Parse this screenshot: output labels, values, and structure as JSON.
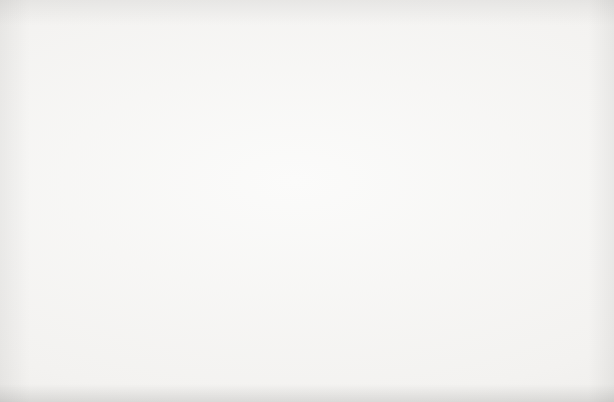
{
  "caption": {
    "fragment": "and red points are years"
  },
  "figure": {
    "background_color": "#f2f1ef",
    "ink_color": "#2b2b2b",
    "point_color": "#3a3a3c"
  },
  "chart_data": {
    "type": "scatter",
    "title": "",
    "xlabel": "Real GDP",
    "xlabel_sub": "(Trillions of 2009 Dollars)",
    "ylabel": "Price level (2009 = 100)",
    "xlim": [
      0.0,
      19.1
    ],
    "ylim": [
      0,
      127
    ],
    "xticks": [
      "0.0",
      "3.0",
      "6.0",
      "9.0",
      "12.0",
      "15.0",
      "18.0"
    ],
    "xtick_values": [
      0.0,
      3.0,
      6.0,
      9.0,
      12.0,
      15.0,
      18.0
    ],
    "yticks": [
      "0",
      "20",
      "40",
      "60",
      "80",
      "100",
      "120"
    ],
    "ytick_values": [
      0,
      20,
      40,
      60,
      80,
      100,
      120
    ],
    "grid": false,
    "legend": "none",
    "series": [
      {
        "name": "US Real GDP vs Price Level, 1929-2014",
        "marker": "circle",
        "color": "#3a3a3c",
        "points": [
          {
            "year": 1929,
            "x": 1.06,
            "y": 10.6
          },
          {
            "year": 1930,
            "x": 0.97,
            "y": 10.2
          },
          {
            "year": 1931,
            "x": 0.9,
            "y": 9.2
          },
          {
            "year": 1932,
            "x": 0.79,
            "y": 8.2
          },
          {
            "year": 1933,
            "x": 0.78,
            "y": 8.0
          },
          {
            "year": 1934,
            "x": 0.86,
            "y": 8.3
          },
          {
            "year": 1935,
            "x": 0.94,
            "y": 8.4
          },
          {
            "year": 1936,
            "x": 1.06,
            "y": 8.5
          },
          {
            "year": 1937,
            "x": 1.11,
            "y": 8.8
          },
          {
            "year": 1938,
            "x": 1.07,
            "y": 8.6
          },
          {
            "year": 1939,
            "x": 1.16,
            "y": 8.5
          },
          {
            "year": 1940,
            "x": 1.27,
            "y": 8.6
          },
          {
            "year": 1941,
            "x": 1.49,
            "y": 9.2
          },
          {
            "year": 1942,
            "x": 1.77,
            "y": 9.9
          },
          {
            "year": 1943,
            "x": 2.07,
            "y": 10.4
          },
          {
            "year": 1944,
            "x": 2.24,
            "y": 10.7
          },
          {
            "year": 1945,
            "x": 2.22,
            "y": 11.0
          },
          {
            "year": 1946,
            "x": 1.96,
            "y": 12.4
          },
          {
            "year": 1947,
            "x": 1.94,
            "y": 13.8
          },
          {
            "year": 1948,
            "x": 2.02,
            "y": 14.5
          },
          {
            "year": 1949,
            "x": 2.01,
            "y": 14.4
          },
          {
            "year": 1950,
            "x": 2.18,
            "y": 14.6
          },
          {
            "year": 1951,
            "x": 2.36,
            "y": 15.6
          },
          {
            "year": 1952,
            "x": 2.45,
            "y": 15.9
          },
          {
            "year": 1953,
            "x": 2.57,
            "y": 16.1
          },
          {
            "year": 1954,
            "x": 2.55,
            "y": 16.3
          },
          {
            "year": 1955,
            "x": 2.73,
            "y": 16.5
          },
          {
            "year": 1956,
            "x": 2.79,
            "y": 17.0
          },
          {
            "year": 1957,
            "x": 2.85,
            "y": 17.6
          },
          {
            "year": 1958,
            "x": 2.83,
            "y": 17.9
          },
          {
            "year": 1959,
            "x": 3.03,
            "y": 18.1
          },
          {
            "year": 1960,
            "x": 3.11,
            "y": 18.4
          },
          {
            "year": 1961,
            "x": 3.19,
            "y": 18.6
          },
          {
            "year": 1962,
            "x": 3.38,
            "y": 18.8
          },
          {
            "year": 1963,
            "x": 3.53,
            "y": 19.0
          },
          {
            "year": 1964,
            "x": 3.73,
            "y": 19.3
          },
          {
            "year": 1965,
            "x": 3.97,
            "y": 19.7
          },
          {
            "year": 1966,
            "x": 4.23,
            "y": 20.3
          },
          {
            "year": 1967,
            "x": 4.34,
            "y": 20.9
          },
          {
            "year": 1968,
            "x": 4.55,
            "y": 21.8
          },
          {
            "year": 1969,
            "x": 4.69,
            "y": 22.9
          },
          {
            "year": 1970,
            "x": 4.7,
            "y": 24.1
          },
          {
            "year": 1971,
            "x": 4.85,
            "y": 25.3
          },
          {
            "year": 1972,
            "x": 5.11,
            "y": 26.4
          },
          {
            "year": 1973,
            "x": 5.4,
            "y": 27.9
          },
          {
            "year": 1974,
            "x": 5.37,
            "y": 30.4
          },
          {
            "year": 1975,
            "x": 5.36,
            "y": 33.2
          },
          {
            "year": 1976,
            "x": 5.65,
            "y": 35.1
          },
          {
            "year": 1977,
            "x": 5.91,
            "y": 37.3
          },
          {
            "year": 1978,
            "x": 6.24,
            "y": 40.0
          },
          {
            "year": 1979,
            "x": 6.44,
            "y": 43.3
          },
          {
            "year": 1980,
            "x": 6.42,
            "y": 47.2
          },
          {
            "year": 1981,
            "x": 6.58,
            "y": 51.6
          },
          {
            "year": 1982,
            "x": 6.49,
            "y": 54.8
          },
          {
            "year": 1983,
            "x": 6.79,
            "y": 57.0
          },
          {
            "year": 1984,
            "x": 7.29,
            "y": 59.1
          },
          {
            "year": 1985,
            "x": 7.59,
            "y": 60.9
          },
          {
            "year": 1986,
            "x": 7.85,
            "y": 62.2
          },
          {
            "year": 1987,
            "x": 8.11,
            "y": 64.0
          },
          {
            "year": 1988,
            "x": 8.45,
            "y": 66.2
          },
          {
            "year": 1989,
            "x": 8.79,
            "y": 68.9
          },
          {
            "year": 1990,
            "x": 8.95,
            "y": 71.5
          },
          {
            "year": 1991,
            "x": 8.94,
            "y": 73.9
          },
          {
            "year": 1992,
            "x": 9.27,
            "y": 75.6
          },
          {
            "year": 1993,
            "x": 9.53,
            "y": 77.4
          },
          {
            "year": 1994,
            "x": 9.91,
            "y": 79.0
          },
          {
            "year": 1995,
            "x": 10.17,
            "y": 80.6
          },
          {
            "year": 1996,
            "x": 10.56,
            "y": 82.2
          },
          {
            "year": 1997,
            "x": 11.03,
            "y": 83.6
          },
          {
            "year": 1998,
            "x": 11.53,
            "y": 84.6
          },
          {
            "year": 1999,
            "x": 12.07,
            "y": 86.0
          },
          {
            "year": 2000,
            "x": 12.56,
            "y": 87.9
          },
          {
            "year": 2001,
            "x": 12.68,
            "y": 89.9
          },
          {
            "year": 2002,
            "x": 12.91,
            "y": 91.4
          },
          {
            "year": 2003,
            "x": 13.27,
            "y": 93.1
          },
          {
            "year": 2004,
            "x": 13.77,
            "y": 95.4
          },
          {
            "year": 2005,
            "x": 14.23,
            "y": 98.1
          },
          {
            "year": 2006,
            "x": 14.61,
            "y": 101.0
          },
          {
            "year": 2007,
            "x": 14.87,
            "y": 103.3
          },
          {
            "year": 2008,
            "x": 14.83,
            "y": 105.2
          },
          {
            "year": 2009,
            "x": 14.42,
            "y": 100.0
          },
          {
            "year": 2010,
            "x": 14.78,
            "y": 101.2
          },
          {
            "year": 2011,
            "x": 15.02,
            "y": 103.3
          },
          {
            "year": 2012,
            "x": 15.35,
            "y": 105.2
          },
          {
            "year": 2013,
            "x": 15.58,
            "y": 106.7
          },
          {
            "year": 2014,
            "x": 15.96,
            "y": 108.3
          }
        ]
      }
    ],
    "annotations": [
      {
        "label": "1929",
        "text_x": 92,
        "text_y": 300,
        "leader": true,
        "to_x": 110,
        "to_y": 318
      },
      {
        "label": "1933",
        "text_x": 69,
        "text_y": 337,
        "leader": true,
        "to_x": 90,
        "to_y": 325
      },
      {
        "label": "1940",
        "text_x": 116,
        "text_y": 330,
        "leader": true,
        "to_x": 112,
        "to_y": 320
      },
      {
        "label": "1950",
        "text_x": 100,
        "text_y": 282,
        "leader": true,
        "to_x": 125,
        "to_y": 305
      },
      {
        "label": "1960",
        "text_x": 145,
        "text_y": 312,
        "leader": true,
        "to_x": 135,
        "to_y": 299
      },
      {
        "label": "1970",
        "text_x": 214,
        "text_y": 293,
        "leader": true,
        "to_x": 196,
        "to_y": 282
      },
      {
        "label": "1974",
        "text_x": 232,
        "text_y": 271,
        "leader": true,
        "to_x": 212,
        "to_y": 265
      },
      {
        "label": "1975",
        "text_x": 172,
        "text_y": 256,
        "leader": true,
        "to_x": 210,
        "to_y": 258
      },
      {
        "label": "1980",
        "text_x": 218,
        "text_y": 229,
        "leader": false,
        "to_x": 0,
        "to_y": 0
      },
      {
        "label": "1982",
        "text_x": 221,
        "text_y": 212,
        "leader": false,
        "to_x": 0,
        "to_y": 0
      },
      {
        "label": "1991",
        "text_x": 288,
        "text_y": 172,
        "leader": false,
        "to_x": 0,
        "to_y": 0
      },
      {
        "label": "2000",
        "text_x": 434,
        "text_y": 152,
        "leader": true,
        "to_x": 413,
        "to_y": 140
      },
      {
        "label": "2009",
        "text_x": 420,
        "text_y": 86,
        "leader": true,
        "to_x": 464,
        "to_y": 89
      }
    ],
    "curves": [
      {
        "name": "AS",
        "subscript": "2014",
        "label_x": 524,
        "label_y": 26
      },
      {
        "name": "AD",
        "subscript": "2014",
        "label_x": 538,
        "label_y": 70
      }
    ]
  }
}
